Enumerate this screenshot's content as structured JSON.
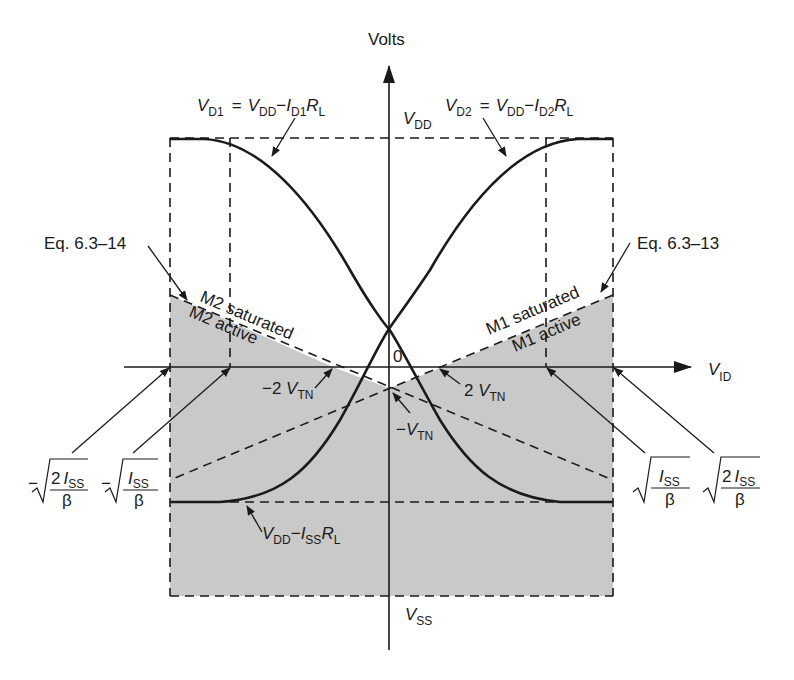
{
  "diagram": {
    "colors": {
      "background": "#ffffff",
      "ink": "#1a1a1a",
      "shade": "#c8c8c8"
    },
    "axes": {
      "y_label": "Volts",
      "x_label_main": "V",
      "x_label_sub": "ID",
      "origin_label": "0"
    },
    "curves": {
      "vd1": {
        "lhs_main": "V",
        "lhs_sub": "D1",
        "eq": "=",
        "vdd_main": "V",
        "vdd_sub": "DD",
        "minus": "−",
        "i_main": "I",
        "i_sub": "D1",
        "r_main": "R",
        "r_sub": "L"
      },
      "vd2": {
        "lhs_main": "V",
        "lhs_sub": "D2",
        "eq": "=",
        "vdd_main": "V",
        "vdd_sub": "DD",
        "minus": "−",
        "i_main": "I",
        "i_sub": "D2",
        "r_main": "R",
        "r_sub": "L"
      }
    },
    "levels": {
      "vdd": {
        "main": "V",
        "sub": "DD"
      },
      "vss": {
        "main": "V",
        "sub": "SS"
      },
      "low": {
        "vdd_main": "V",
        "vdd_sub": "DD",
        "minus": "−",
        "i_main": "I",
        "i_sub": "SS",
        "r_main": "R",
        "r_sub": "L"
      }
    },
    "equations": {
      "left": "Eq. 6.3–14",
      "right": "Eq. 6.3–13"
    },
    "regions": {
      "m2_saturated": "M2 saturated",
      "m2_active": "M2 active",
      "m1_saturated": "M1 saturated",
      "m1_active": "M1 active"
    },
    "threshold_labels": {
      "neg_2vtn": {
        "prefix": "−2 ",
        "main": "V",
        "sub": "TN"
      },
      "pos_2vtn": {
        "prefix": "2 ",
        "main": "V",
        "sub": "TN"
      },
      "neg_vtn": {
        "prefix": "−",
        "main": "V",
        "sub": "TN"
      }
    },
    "sqrt_labels": {
      "neg_2iss": {
        "sign": "−",
        "num_coef": "2",
        "num_main": "I",
        "num_sub": "SS",
        "den": "β"
      },
      "neg_iss": {
        "sign": "−",
        "num_coef": "",
        "num_main": "I",
        "num_sub": "SS",
        "den": "β"
      },
      "pos_iss": {
        "sign": "",
        "num_coef": "",
        "num_main": "I",
        "num_sub": "SS",
        "den": "β"
      },
      "pos_2iss": {
        "sign": "",
        "num_coef": "2",
        "num_main": "I",
        "num_sub": "SS",
        "den": "β"
      }
    }
  }
}
